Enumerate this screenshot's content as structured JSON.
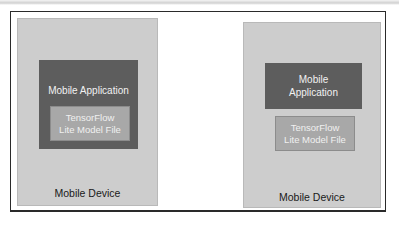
{
  "diagram": {
    "left": {
      "device_label": "Mobile Device",
      "app_label": "Mobile Application",
      "model_label": "TensorFlow\nLite Model File"
    },
    "right": {
      "device_label": "Mobile Device",
      "app_label": "Mobile\nApplication",
      "model_label": "TensorFlow\nLite Model File"
    },
    "colors": {
      "device": "#cdcdcd",
      "application": "#5d5d5d",
      "model_file": "#a8a8a8"
    }
  }
}
